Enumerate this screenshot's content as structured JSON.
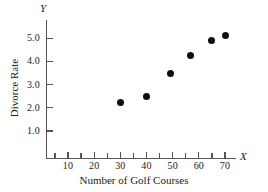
{
  "chart_data": {
    "type": "scatter",
    "title": "",
    "xlabel": "Number of Golf Courses",
    "ylabel": "Divorce Rate",
    "x_axis_letter": "X",
    "y_axis_letter": "Y",
    "xlim": [
      0,
      75
    ],
    "ylim": [
      0,
      5.6
    ],
    "grid": false,
    "legend": null,
    "x_ticks_major": [
      10,
      20,
      30,
      40,
      50,
      60,
      70
    ],
    "x_tick_labels": [
      "10",
      "20",
      "30",
      "40",
      "50",
      "60",
      "70"
    ],
    "x_ticks_minor": [
      5,
      15,
      25,
      35,
      45,
      55,
      65
    ],
    "y_ticks": [
      1.0,
      2.0,
      3.0,
      4.0,
      5.0
    ],
    "y_tick_labels": [
      "1.0",
      "2.0",
      "3.0",
      "4.0",
      "5.0"
    ],
    "points": [
      {
        "x": 30,
        "y": 2.25
      },
      {
        "x": 40,
        "y": 2.5
      },
      {
        "x": 49,
        "y": 3.5
      },
      {
        "x": 57,
        "y": 4.25
      },
      {
        "x": 65,
        "y": 4.9
      },
      {
        "x": 70,
        "y": 5.1
      }
    ],
    "marker_color": "#0d0d0d",
    "axis_color": "#55555a"
  }
}
